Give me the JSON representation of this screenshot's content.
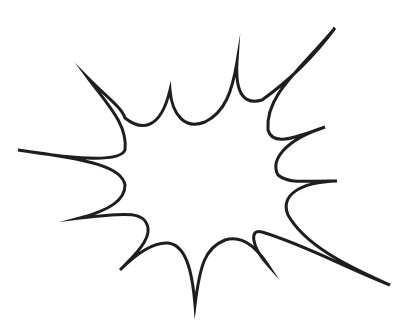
{
  "illustration": {
    "subject": "comic explosion burst outline",
    "background_color": "#ffffff",
    "stroke_color": "#1e1e1e",
    "fill_color": "#ffffff"
  }
}
